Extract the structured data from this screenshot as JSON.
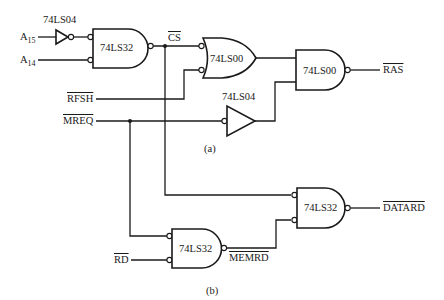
{
  "diagram": {
    "part_a_label": "(a)",
    "part_b_label": "(b)",
    "inputs": {
      "a15": {
        "base": "A",
        "sub": "15"
      },
      "a14": {
        "base": "A",
        "sub": "14"
      },
      "rfsh": "RFSH",
      "mreq": "MREQ",
      "rd": "RD"
    },
    "internal_signals": {
      "cs": "CS",
      "memrd": "MEMRD"
    },
    "outputs": {
      "ras": "RAS",
      "datard": "DATARD"
    },
    "gates": [
      {
        "id": "inv1",
        "type": "inverter",
        "chip": "74LS04"
      },
      {
        "id": "or1",
        "type": "and-neg-or",
        "chip": "74LS32"
      },
      {
        "id": "nand-or",
        "type": "or-neg-in",
        "chip": "74LS00"
      },
      {
        "id": "nand2",
        "type": "nand",
        "chip": "74LS00"
      },
      {
        "id": "inv2",
        "type": "inverter",
        "chip": "74LS04"
      },
      {
        "id": "or-memrd",
        "type": "and-neg-or",
        "chip": "74LS32"
      },
      {
        "id": "or-datard",
        "type": "and-neg-or",
        "chip": "74LS32"
      }
    ],
    "overbar_signals": [
      "CS",
      "RFSH",
      "MREQ",
      "RAS",
      "RD",
      "MEMRD",
      "DATARD"
    ]
  }
}
